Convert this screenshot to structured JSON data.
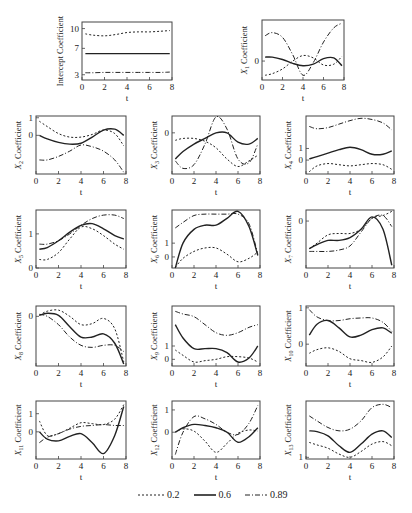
{
  "chart_data": {
    "type": "line",
    "layout": "grid of small multiples (5 rows)",
    "legend": {
      "position": "bottom",
      "entries": [
        {
          "label": "0.2",
          "style": "dotted"
        },
        {
          "label": "0.6",
          "style": "solid"
        },
        {
          "label": "0.89",
          "style": "dash-dot"
        }
      ]
    },
    "x": [
      0.3,
      1,
      2,
      3,
      4,
      5,
      6,
      7,
      7.8
    ],
    "xlabel": "t",
    "xticks": [
      0,
      2,
      4,
      6,
      8
    ],
    "xlim": [
      0,
      8
    ],
    "panels": [
      {
        "id": "intercept",
        "ylabel": "Intercept Coefficient",
        "yticks": [
          "3",
          "7",
          "10"
        ],
        "ytick_vals": [
          3,
          7,
          10
        ],
        "ylim": [
          2.2,
          11
        ],
        "series": [
          {
            "name": "0.2",
            "values": [
              9.2,
              9.0,
              8.9,
              9.1,
              9.4,
              9.5,
              9.5,
              9.6,
              9.7
            ]
          },
          {
            "name": "0.6",
            "values": [
              6.2,
              6.2,
              6.2,
              6.2,
              6.2,
              6.2,
              6.2,
              6.2,
              6.2
            ]
          },
          {
            "name": "0.89",
            "values": [
              3.3,
              3.3,
              3.35,
              3.35,
              3.35,
              3.35,
              3.35,
              3.35,
              3.4
            ]
          }
        ]
      },
      {
        "id": "x1",
        "ylabel": "X1 Coefficient",
        "ylabel_main": "X",
        "ylabel_sub": "1",
        "ylabel_rest": " Coefficient",
        "yticks": [
          "0"
        ],
        "ytick_vals": [
          0
        ],
        "ylim": [
          -1.2,
          2.6
        ],
        "series": [
          {
            "name": "0.2",
            "values": [
              -0.9,
              -0.8,
              -0.5,
              0.0,
              0.35,
              0.2,
              -0.25,
              -0.2,
              0.3
            ]
          },
          {
            "name": "0.6",
            "values": [
              0.25,
              0.25,
              0.1,
              -0.15,
              -0.3,
              -0.2,
              0.15,
              0.2,
              -0.3
            ]
          },
          {
            "name": "0.89",
            "values": [
              1.6,
              1.8,
              1.5,
              0.4,
              -0.9,
              -0.1,
              1.2,
              2.1,
              2.4
            ]
          }
        ]
      },
      {
        "id": "x2",
        "ylabel": "X2 Coefficient",
        "ylabel_main": "X",
        "ylabel_sub": "2",
        "ylabel_rest": " Coefficient",
        "yticks": [
          "1",
          "0"
        ],
        "ytick_vals": [
          1,
          0
        ],
        "ylim": [
          -2.2,
          1.1
        ],
        "series": [
          {
            "name": "0.2",
            "values": [
              0.8,
              0.5,
              0.1,
              -0.1,
              -0.1,
              0.05,
              0.3,
              0.1,
              -0.6
            ]
          },
          {
            "name": "0.6",
            "values": [
              0.0,
              -0.2,
              -0.4,
              -0.5,
              -0.45,
              -0.1,
              0.3,
              0.35,
              0.0
            ]
          },
          {
            "name": "0.89",
            "values": [
              -1.4,
              -1.4,
              -1.2,
              -0.9,
              -0.55,
              -0.65,
              -0.9,
              -1.4,
              -2.1
            ]
          }
        ]
      },
      {
        "id": "x3",
        "ylabel": "X3 Coefficient",
        "ylabel_main": "X",
        "ylabel_sub": "3",
        "ylabel_rest": " Coefficient",
        "yticks": [
          "0"
        ],
        "ytick_vals": [
          0
        ],
        "ylim": [
          -2.2,
          0.9
        ],
        "series": [
          {
            "name": "0.2",
            "values": [
              -0.4,
              -0.3,
              -0.3,
              -0.45,
              -0.8,
              -1.4,
              -1.8,
              -1.5,
              -1.2
            ]
          },
          {
            "name": "0.6",
            "values": [
              -1.4,
              -1.0,
              -0.6,
              -0.3,
              0.0,
              0.0,
              -0.5,
              -0.6,
              -0.3
            ]
          },
          {
            "name": "0.89",
            "values": [
              -1.5,
              -1.9,
              -1.7,
              -0.6,
              0.85,
              0.2,
              -1.4,
              -1.6,
              -0.6
            ]
          }
        ]
      },
      {
        "id": "x4",
        "ylabel": "X4 Coefficient",
        "ylabel_main": "X",
        "ylabel_sub": "4",
        "ylabel_rest": " Coefficient",
        "yticks": [
          "1",
          "0"
        ],
        "ytick_vals": [
          1,
          0
        ],
        "ylim": [
          -1.2,
          3.8
        ],
        "series": [
          {
            "name": "0.2",
            "values": [
              -1.0,
              -0.5,
              -0.3,
              -0.4,
              -0.5,
              -0.4,
              -0.3,
              -0.4,
              -0.8
            ]
          },
          {
            "name": "0.6",
            "values": [
              0.1,
              0.3,
              0.6,
              0.9,
              1.1,
              0.9,
              0.5,
              0.5,
              0.8
            ]
          },
          {
            "name": "0.89",
            "values": [
              2.9,
              2.7,
              2.8,
              3.1,
              3.4,
              3.6,
              3.5,
              3.2,
              2.6
            ]
          }
        ]
      },
      {
        "id": "x5",
        "ylabel": "X5 Coefficient",
        "ylabel_main": "X",
        "ylabel_sub": "5",
        "ylabel_rest": " Coefficient",
        "yticks": [
          "1",
          "0"
        ],
        "ytick_vals": [
          1,
          0
        ],
        "ylim": [
          0,
          1.7
        ],
        "series": [
          {
            "name": "0.2",
            "values": [
              0.25,
              0.25,
              0.45,
              0.85,
              1.2,
              1.15,
              0.95,
              0.7,
              0.55
            ]
          },
          {
            "name": "0.6",
            "values": [
              0.55,
              0.6,
              0.8,
              1.05,
              1.25,
              1.3,
              1.15,
              0.95,
              0.85
            ]
          },
          {
            "name": "0.89",
            "values": [
              0.7,
              0.7,
              0.8,
              1.0,
              1.25,
              1.45,
              1.55,
              1.55,
              1.45
            ]
          }
        ]
      },
      {
        "id": "x6",
        "ylabel": "X6 Coefficient",
        "ylabel_main": "X",
        "ylabel_sub": "6",
        "ylabel_rest": " Coefficient",
        "yticks": [
          "1",
          "0"
        ],
        "ytick_vals": [
          1,
          0
        ],
        "ylim": [
          -0.8,
          3.4
        ],
        "series": [
          {
            "name": "0.2",
            "values": [
              -0.75,
              -0.1,
              0.4,
              0.65,
              0.65,
              0.2,
              -0.35,
              -0.1,
              0.35
            ]
          },
          {
            "name": "0.6",
            "values": [
              -0.8,
              1.0,
              2.0,
              2.3,
              2.3,
              2.8,
              3.3,
              2.2,
              0.1
            ]
          },
          {
            "name": "0.89",
            "values": [
              2.1,
              2.5,
              3.0,
              3.1,
              3.1,
              3.1,
              3.1,
              2.4,
              0.2
            ]
          }
        ]
      },
      {
        "id": "x7",
        "ylabel": "X7 Coefficient",
        "ylabel_main": "X",
        "ylabel_sub": "7",
        "ylabel_rest": " Coefficient",
        "yticks": [
          "0"
        ],
        "ytick_vals": [
          0
        ],
        "ylim": [
          -1.7,
          0.4
        ],
        "series": [
          {
            "name": "0.2",
            "values": [
              -1.0,
              -0.8,
              -0.5,
              -0.45,
              -0.45,
              -0.3,
              0.1,
              0.2,
              0.35
            ]
          },
          {
            "name": "0.6",
            "values": [
              -1.0,
              -0.85,
              -0.7,
              -0.7,
              -0.6,
              -0.3,
              0.15,
              -0.3,
              -1.6
            ]
          },
          {
            "name": "0.89",
            "values": [
              -1.1,
              -1.1,
              -1.1,
              -1.05,
              -0.9,
              -0.4,
              0.1,
              0.2,
              -0.2
            ]
          }
        ]
      },
      {
        "id": "x8",
        "ylabel": "X8 Coefficient",
        "ylabel_main": "X",
        "ylabel_sub": "8",
        "ylabel_rest": " Coefficient",
        "yticks": [
          "0"
        ],
        "ytick_vals": [
          0
        ],
        "ylim": [
          -2.4,
          0.5
        ],
        "series": [
          {
            "name": "0.2",
            "values": [
              0.05,
              0.25,
              0.3,
              0.0,
              -0.4,
              -0.35,
              -0.1,
              -0.6,
              -2.2
            ]
          },
          {
            "name": "0.6",
            "values": [
              0.05,
              0.15,
              0.05,
              -0.5,
              -1.0,
              -1.0,
              -0.85,
              -1.3,
              -2.3
            ]
          },
          {
            "name": "0.89",
            "values": [
              0.1,
              0.0,
              -0.4,
              -1.0,
              -1.4,
              -1.5,
              -1.4,
              -1.4,
              -1.7
            ]
          }
        ]
      },
      {
        "id": "x9",
        "ylabel": "X9 Coefficient",
        "ylabel_main": "X",
        "ylabel_sub": "9",
        "ylabel_rest": " Coefficient",
        "yticks": [
          "1",
          "0"
        ],
        "ytick_vals": [
          1,
          0
        ],
        "ylim": [
          -0.5,
          4.0
        ],
        "series": [
          {
            "name": "0.2",
            "values": [
              0.7,
              0.3,
              -0.2,
              -0.1,
              0.0,
              0.2,
              0.2,
              0.1,
              -0.2
            ]
          },
          {
            "name": "0.6",
            "values": [
              2.6,
              1.6,
              0.8,
              0.8,
              0.8,
              0.5,
              -0.2,
              0.1,
              1.0
            ]
          },
          {
            "name": "0.89",
            "values": [
              3.6,
              3.4,
              3.2,
              2.6,
              2.0,
              1.8,
              2.0,
              2.4,
              2.6
            ]
          }
        ]
      },
      {
        "id": "x10",
        "ylabel": "X10 Coefficient",
        "ylabel_main": "X",
        "ylabel_sub": "10",
        "ylabel_rest": " Coefficient",
        "yticks": [
          "1",
          "0"
        ],
        "ytick_vals": [
          1,
          0
        ],
        "ylim": [
          -0.6,
          1.05
        ],
        "series": [
          {
            "name": "0.2",
            "values": [
              -0.25,
              -0.15,
              -0.1,
              -0.2,
              -0.4,
              -0.45,
              -0.5,
              -0.35,
              -0.05
            ]
          },
          {
            "name": "0.6",
            "values": [
              0.25,
              0.55,
              0.65,
              0.45,
              0.2,
              0.25,
              0.4,
              0.45,
              0.3
            ]
          },
          {
            "name": "0.89",
            "values": [
              0.95,
              0.75,
              0.65,
              0.65,
              0.7,
              0.72,
              0.72,
              0.6,
              0.35
            ]
          }
        ]
      },
      {
        "id": "x11",
        "ylabel": "X11 Coefficient",
        "ylabel_main": "X",
        "ylabel_sub": "11",
        "ylabel_rest": " Coefficient",
        "yticks": [
          "1",
          "0"
        ],
        "ytick_vals": [
          1,
          0
        ],
        "ylim": [
          -1.5,
          1.7
        ],
        "series": [
          {
            "name": "0.2",
            "values": [
              0.6,
              -0.2,
              -0.1,
              0.2,
              0.5,
              0.45,
              0.4,
              0.7,
              1.5
            ]
          },
          {
            "name": "0.6",
            "values": [
              0.0,
              -0.4,
              -0.5,
              -0.25,
              -0.1,
              -0.6,
              -1.2,
              -0.2,
              1.4
            ]
          },
          {
            "name": "0.89",
            "values": [
              -0.6,
              -0.3,
              -0.1,
              0.15,
              0.3,
              0.35,
              0.4,
              0.35,
              0.35
            ]
          }
        ]
      },
      {
        "id": "x12",
        "ylabel": "X12 Coefficient",
        "ylabel_main": "X",
        "ylabel_sub": "12",
        "ylabel_rest": " Coefficient",
        "yticks": [
          "1",
          "0"
        ],
        "ytick_vals": [
          1,
          0
        ],
        "ylim": [
          -1.2,
          1.4
        ],
        "series": [
          {
            "name": "0.2",
            "values": [
              0.0,
              0.15,
              0.05,
              -0.4,
              -0.9,
              -0.5,
              -0.05,
              0.1,
              0.05
            ]
          },
          {
            "name": "0.6",
            "values": [
              0.0,
              0.2,
              0.35,
              0.3,
              0.2,
              0.0,
              -0.45,
              -0.2,
              0.2
            ]
          },
          {
            "name": "0.89",
            "values": [
              -1.0,
              0.0,
              0.7,
              0.6,
              0.35,
              0.0,
              -0.1,
              0.4,
              1.2
            ]
          }
        ]
      },
      {
        "id": "x13",
        "ylabel": "X13 Coefficient",
        "ylabel_main": "X",
        "ylabel_sub": "13",
        "ylabel_rest": " Coefficient",
        "yticks": [
          "1"
        ],
        "ytick_vals": [
          1
        ],
        "ylim": [
          0.9,
          4.4
        ],
        "series": [
          {
            "name": "0.2",
            "values": [
              1.9,
              1.75,
              1.55,
              1.2,
              1.0,
              1.35,
              1.8,
              1.95,
              1.7
            ]
          },
          {
            "name": "0.6",
            "values": [
              2.6,
              2.55,
              2.3,
              1.7,
              1.3,
              1.8,
              2.4,
              2.6,
              2.2
            ]
          },
          {
            "name": "0.89",
            "values": [
              3.5,
              3.2,
              2.8,
              2.6,
              2.7,
              3.2,
              4.0,
              4.2,
              4.0
            ]
          }
        ]
      }
    ]
  },
  "legend": {
    "items": [
      {
        "label": "0.2"
      },
      {
        "label": "0.6"
      },
      {
        "label": "0.89"
      }
    ]
  }
}
